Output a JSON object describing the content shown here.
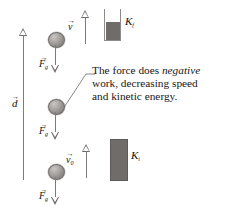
{
  "figure": {
    "type": "physics-free-body-diagram",
    "colors": {
      "ball_fill": "#a9a5a2",
      "arrow_gray": "#7d7a77",
      "bar_fill": "#6f6c69",
      "text": "#171717",
      "background": "#ffffff"
    }
  },
  "displacement": {
    "symbol": "d",
    "vector_accent": "→",
    "direction": "up"
  },
  "velocity_top": {
    "symbol": "v",
    "subscript": "",
    "vector_accent": "→",
    "direction": "up"
  },
  "velocity_bottom": {
    "symbol": "v",
    "subscript": "0",
    "vector_accent": "→",
    "direction": "up"
  },
  "forces": [
    {
      "symbol": "F",
      "subscript": "g",
      "vector_accent": "→",
      "direction": "down",
      "position": "top"
    },
    {
      "symbol": "F",
      "subscript": "g",
      "vector_accent": "→",
      "direction": "down",
      "position": "middle"
    },
    {
      "symbol": "F",
      "subscript": "g",
      "vector_accent": "→",
      "direction": "down",
      "position": "bottom"
    }
  ],
  "energy_bars": [
    {
      "label": "K",
      "subscript": "f",
      "name": "final-kinetic-energy",
      "fill_percent": 58,
      "style": "outlined-container"
    },
    {
      "label": "K",
      "subscript": "i",
      "name": "initial-kinetic-energy",
      "fill_percent": 100,
      "style": "solid-bar"
    }
  ],
  "caption": {
    "line1_a": "The force does ",
    "line1_em": "negative",
    "line2": "work, decreasing speed",
    "line3": "and kinetic energy."
  }
}
